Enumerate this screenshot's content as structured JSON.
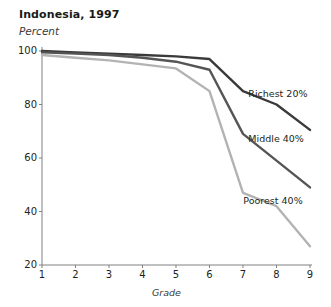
{
  "chart_data": {
    "type": "line",
    "title": "Indonesia, 1997",
    "subtitle": "Percent",
    "xlabel": "Grade",
    "ylabel": "Percent",
    "x": [
      1,
      2,
      3,
      4,
      5,
      6,
      7,
      8,
      9
    ],
    "xticklabels": [
      "1",
      "2",
      "3",
      "4",
      "5",
      "6",
      "7",
      "8",
      "9"
    ],
    "yticks": [
      20,
      40,
      60,
      80,
      100
    ],
    "yticklabels": [
      "20",
      "40",
      "60",
      "80",
      "100"
    ],
    "xlim": [
      1,
      9
    ],
    "ylim": [
      20,
      100
    ],
    "grid": false,
    "legend_position": "inline-right-of-line",
    "series": [
      {
        "name": "Richest 20%",
        "color": "#3a3a3a",
        "values": [
          100,
          99.5,
          99,
          98.5,
          98,
          97,
          85,
          80,
          70.5
        ],
        "label_x": 7.1,
        "label_y": 84
      },
      {
        "name": "Middle 40%",
        "color": "#555555",
        "values": [
          99.5,
          99,
          98.5,
          97.5,
          96,
          93,
          69,
          59,
          49
        ],
        "label_x": 7.1,
        "label_y": 67
      },
      {
        "name": "Poorest 40%",
        "color": "#b3b3b3",
        "values": [
          98.5,
          97.5,
          96.5,
          95,
          93.5,
          85,
          47,
          42,
          27
        ],
        "label_x": 6.95,
        "label_y": 44
      }
    ]
  },
  "axes": {
    "axis_color": "#808080",
    "background": "#ffffff"
  }
}
